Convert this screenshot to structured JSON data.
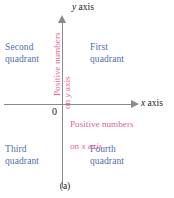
{
  "figure": {
    "caption": "(a)",
    "axes": {
      "y_axis_label_prefix": "y",
      "y_axis_label_suffix": " axis",
      "x_axis_label_prefix": "x",
      "x_axis_label_suffix": " axis",
      "origin_label": "0"
    },
    "quadrants": [
      {
        "name": "first",
        "label": "First\nquadrant"
      },
      {
        "name": "second",
        "label": "Second\nquadrant"
      },
      {
        "name": "third",
        "label": "Third\nquadrant"
      },
      {
        "name": "fourth",
        "label": "Fourth\nquadrant"
      }
    ],
    "notes": {
      "y_axis_note_line1": "Positive numbers",
      "y_axis_note_line2_prefix": "on ",
      "y_axis_note_line2_var": "y",
      "y_axis_note_line2_suffix": " axis",
      "x_axis_note_line1": "Positive numbers",
      "x_axis_note_line2_prefix": "on ",
      "x_axis_note_line2_var": "x",
      "x_axis_note_line2_suffix": " axis"
    },
    "colors": {
      "quadrant_text": "#4f6fa8",
      "note_text": "#e4659b",
      "axis_line": "#8a8a8a",
      "axis_label_text": "#1a1a1a",
      "background": "#ffffff"
    }
  }
}
